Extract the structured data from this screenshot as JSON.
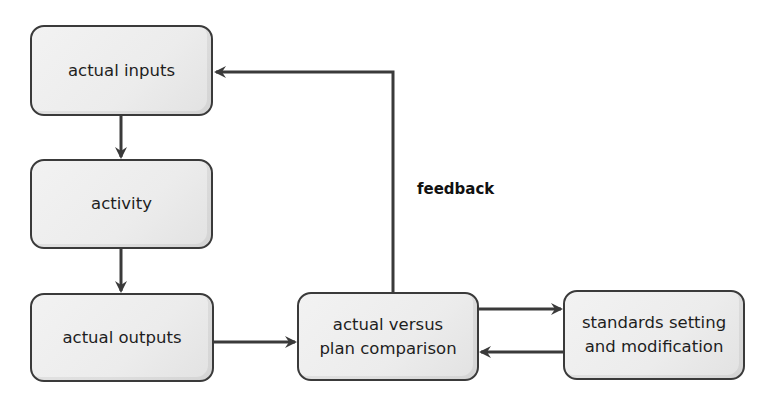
{
  "diagram": {
    "type": "flowchart",
    "colors": {
      "stroke": "#3a3a3a",
      "fill": "#eeeeee",
      "text": "#1e1e1e"
    },
    "nodes": [
      {
        "id": "actual-inputs",
        "label": "actual inputs"
      },
      {
        "id": "activity",
        "label": "activity"
      },
      {
        "id": "actual-outputs",
        "label": "actual outputs"
      },
      {
        "id": "comparison",
        "line1": "actual versus",
        "line2": "plan comparison"
      },
      {
        "id": "standards",
        "line1": "standards setting",
        "line2": "and modification"
      }
    ],
    "edges": [
      {
        "from": "actual-inputs",
        "to": "activity"
      },
      {
        "from": "activity",
        "to": "actual-outputs"
      },
      {
        "from": "actual-outputs",
        "to": "comparison"
      },
      {
        "from": "comparison",
        "to": "standards"
      },
      {
        "from": "standards",
        "to": "comparison"
      },
      {
        "from": "comparison",
        "to": "actual-inputs",
        "label": "feedback"
      }
    ],
    "feedback_label": "feedback"
  }
}
